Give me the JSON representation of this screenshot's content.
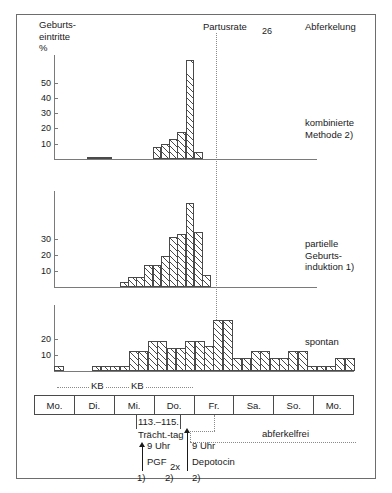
{
  "figure": {
    "y_axis_title": "Geburts-\neintritte\n%",
    "partus_label": "Partusrate",
    "partus_value": "26",
    "top_right_label": "Abferkelung"
  },
  "panels": [
    {
      "name": "kombinierte",
      "side_label": "kombinierte\nMethode 2)",
      "ticks": [
        "50",
        "40",
        "30",
        "20",
        "10"
      ],
      "tick_values": [
        50,
        40,
        30,
        20,
        10
      ]
    },
    {
      "name": "partielle",
      "side_label": "partielle\nGeburts-\ninduktion 1)",
      "ticks": [
        "30",
        "20",
        "10"
      ],
      "tick_values": [
        30,
        20,
        10
      ]
    },
    {
      "name": "spontan",
      "side_label": "spontan",
      "ticks": [
        "20",
        "10"
      ],
      "tick_values": [
        20,
        10
      ]
    }
  ],
  "day_table": {
    "days": [
      "Mo.",
      "Di.",
      "Mi.",
      "Do.",
      "Fr.",
      "Sa.",
      "So.",
      "Mo."
    ]
  },
  "annotations": {
    "kb1": "KB",
    "kb2": "KB",
    "tracht_line1": "113.–115.",
    "tracht_line2": "Trächt.-tag",
    "pgf_time": "9 Uhr",
    "pgf_label": "PGF",
    "pgf_sub": "2x",
    "depotocin_time": "9 Uhr",
    "depotocin_label": "Depotocin",
    "footnote_1": "1)",
    "footnote_2a": "2)",
    "footnote_2b": "2)",
    "abferkelfrei": "abferkelfrei"
  },
  "chart_data": {
    "type": "bar",
    "xlabel": "Wochentag / Stunde",
    "ylabel": "Geburtseintritte %",
    "grid": false,
    "legend_position": "right",
    "annotations": [
      "Partusrate 26",
      "113.–115. Trächt.-tag",
      "9 Uhr PGF 2x",
      "9 Uhr Depotocin",
      "abferkelfrei",
      "KB",
      "KB"
    ],
    "x_categories": [
      "Mo.",
      "Di.",
      "Mi.",
      "Do.",
      "Fr.",
      "Sa.",
      "So.",
      "Mo."
    ],
    "bins_per_day": 4,
    "partus_marker_x": 16,
    "series": [
      {
        "name": "kombinierte Methode 2)",
        "ylim": [
          0,
          62
        ],
        "yticks": [
          10,
          20,
          30,
          40,
          50
        ],
        "values": [
          0,
          0,
          0,
          0,
          1,
          1,
          1,
          0,
          0,
          0,
          0,
          0,
          7,
          9,
          12,
          16,
          59,
          4,
          0,
          0,
          0,
          0,
          0,
          0,
          0,
          0,
          0,
          0,
          0,
          0,
          0,
          0
        ]
      },
      {
        "name": "partielle Geburtsinduktion 1)",
        "ylim": [
          0,
          40
        ],
        "yticks": [
          10,
          20,
          30
        ],
        "values": [
          0,
          0,
          0,
          0,
          0,
          0,
          0,
          0,
          2,
          4,
          4,
          9,
          9,
          13,
          21,
          22,
          35,
          23,
          5,
          0,
          0,
          0,
          0,
          0,
          0,
          0,
          0,
          0,
          0,
          0,
          0,
          0
        ]
      },
      {
        "name": "spontan",
        "ylim": [
          0,
          26
        ],
        "yticks": [
          10,
          20
        ],
        "values": [
          2,
          0,
          0,
          0,
          2,
          2,
          2,
          2,
          8,
          8,
          12,
          12,
          9,
          9,
          12,
          12,
          10,
          20,
          20,
          5,
          5,
          8,
          8,
          5,
          5,
          8,
          8,
          2,
          2,
          2,
          5,
          5
        ]
      }
    ]
  }
}
